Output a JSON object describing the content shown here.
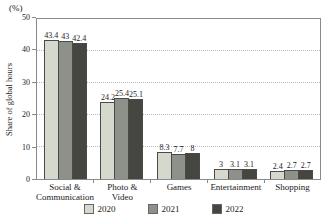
{
  "chart_data": {
    "type": "bar",
    "title": "",
    "unit_label": "(%)",
    "ylabel": "Share of global hours",
    "ylim": [
      0,
      50
    ],
    "yticks": [
      0,
      10,
      20,
      30,
      40,
      50
    ],
    "grid": "horizontal dotted lines at 10, 20, 30, 40",
    "legend_position": "bottom",
    "categories": [
      "Social &\nCommunication",
      "Photo &\nVideo",
      "Games",
      "Entertainment",
      "Shopping"
    ],
    "series": [
      {
        "name": "2020",
        "color": "#d5d8cc",
        "values": [
          43.4,
          24.2,
          8.3,
          3,
          2.4
        ]
      },
      {
        "name": "2021",
        "color": "#8d9189",
        "values": [
          43,
          25.4,
          7.7,
          3.1,
          2.7
        ]
      },
      {
        "name": "2022",
        "color": "#45463f",
        "values": [
          42.4,
          25.1,
          8,
          3.1,
          2.7
        ]
      }
    ]
  }
}
